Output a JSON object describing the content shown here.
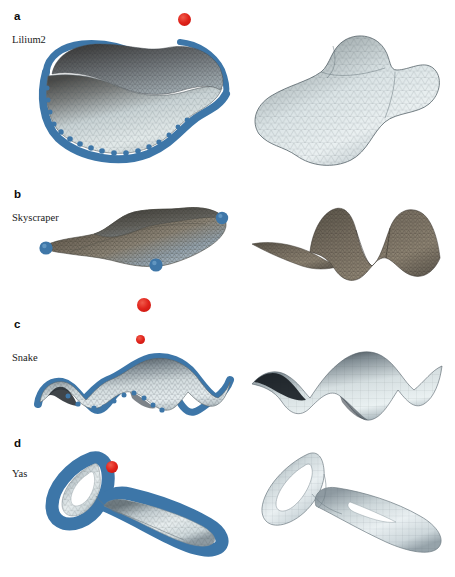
{
  "figure": {
    "background_color": "#ffffff",
    "width": 455,
    "height": 577,
    "columns": [
      "input mesh with constrained boundary",
      "optimized smooth surface"
    ],
    "marker_color": "#d8211a",
    "boundary_color": "#3d76a8",
    "mesh_line_color": "#2d3840"
  },
  "panels": [
    {
      "letter": "a",
      "name": "Lilium2",
      "letter_x": 14,
      "letter_y": 10,
      "name_x": 12,
      "name_y": 34,
      "left": {
        "label": "lilium2-input-mesh",
        "surface_style": "triangulated-shell-light-blue",
        "has_boundary_rim": true,
        "boundary_style": "thick-blue-band",
        "corner_spheres": 0
      },
      "right": {
        "label": "lilium2-result-mesh",
        "surface_style": "smooth-thick-shell-light-blue",
        "has_boundary_rim": false,
        "corner_spheres": 0
      },
      "markers": [
        {
          "name": "marker-a-1",
          "x": 184,
          "y": 19,
          "r": 6.5
        }
      ]
    },
    {
      "letter": "b",
      "name": "Skyscraper",
      "letter_x": 14,
      "letter_y": 188,
      "name_x": 12,
      "name_y": 212,
      "left": {
        "label": "skyscraper-input-mesh",
        "surface_style": "triangulated-shell-dark-bronze",
        "has_boundary_rim": false,
        "corner_spheres": 4
      },
      "right": {
        "label": "skyscraper-result-mesh",
        "surface_style": "smooth-saddle-dark-bronze",
        "has_boundary_rim": false,
        "corner_spheres": 0
      },
      "markers": []
    },
    {
      "letter": "c",
      "name": "Snake",
      "letter_x": 14,
      "letter_y": 318,
      "name_x": 12,
      "name_y": 352,
      "left": {
        "label": "snake-input-mesh",
        "surface_style": "triangulated-arch-light-blue",
        "has_boundary_rim": true,
        "boundary_style": "thick-blue-band",
        "corner_spheres": 0
      },
      "right": {
        "label": "snake-result-mesh",
        "surface_style": "smooth-arch-light-blue",
        "has_boundary_rim": false,
        "corner_spheres": 0
      },
      "markers": [
        {
          "name": "marker-c-1",
          "x": 144,
          "y": 305,
          "r": 7.0
        },
        {
          "name": "marker-c-2",
          "x": 140,
          "y": 339,
          "r": 4.5
        }
      ]
    },
    {
      "letter": "d",
      "name": "Yas",
      "letter_x": 14,
      "letter_y": 437,
      "name_x": 12,
      "name_y": 468,
      "left": {
        "label": "yas-input-mesh",
        "surface_style": "tubular-loop-blue-banded",
        "has_boundary_rim": true,
        "boundary_style": "thick-blue-band",
        "corner_spheres": 0
      },
      "right": {
        "label": "yas-result-mesh",
        "surface_style": "smooth-tubular-loop-light-blue",
        "has_boundary_rim": false,
        "corner_spheres": 0
      },
      "markers": [
        {
          "name": "marker-d-1",
          "x": 138,
          "y": 473,
          "r": 6.0
        }
      ]
    }
  ]
}
